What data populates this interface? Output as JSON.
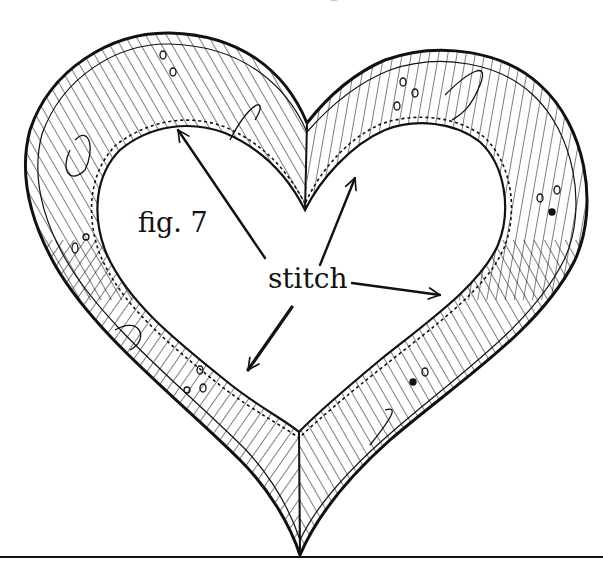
{
  "figure": {
    "caption": "fig. 7",
    "callout_label": "stitch",
    "callout_count": 4
  },
  "colors": {
    "ink": "#111111",
    "paper": "#ffffff"
  },
  "geometry": {
    "outer_heart": {
      "left_lobe_top": [
        150,
        35
      ],
      "right_lobe_top": [
        455,
        47
      ],
      "notch": [
        307,
        123
      ],
      "left_edge": [
        27,
        160
      ],
      "right_edge": [
        585,
        210
      ],
      "bottom_tip": [
        300,
        555
      ]
    },
    "inner_heart": {
      "notch": [
        305,
        210
      ],
      "left_lobe_top": [
        170,
        128
      ],
      "right_lobe_top": [
        445,
        130
      ],
      "left_edge": [
        98,
        200
      ],
      "right_edge": [
        500,
        230
      ],
      "bottom_point": [
        299,
        432
      ]
    },
    "baseline_y": 557,
    "arrows": [
      {
        "from": [
          265,
          258
        ],
        "to": [
          178,
          130
        ]
      },
      {
        "from": [
          320,
          265
        ],
        "to": [
          355,
          178
        ]
      },
      {
        "from": [
          352,
          283
        ],
        "to": [
          440,
          295
        ]
      },
      {
        "from": [
          292,
          307
        ],
        "to": [
          248,
          370
        ]
      }
    ]
  }
}
